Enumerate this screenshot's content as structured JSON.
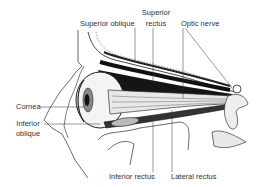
{
  "figure": {
    "colors": {
      "ink": "#222222",
      "label": "#333333",
      "dark_shadow": "#111111",
      "background": "#ffffff"
    }
  },
  "labels": {
    "superior_oblique": "Superior oblique",
    "superior_rectus_line1": "Superior",
    "superior_rectus_line2": "rectus",
    "optic_nerve": "Optic nerve",
    "cornea": "Cornea",
    "inferior_oblique_line1": "Inferior",
    "inferior_oblique_line2": "oblique",
    "inferior_rectus": "Inferior rectus",
    "lateral_rectus": "Lateral rectus"
  }
}
